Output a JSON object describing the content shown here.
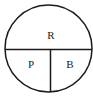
{
  "diagram": {
    "type": "divided-circle",
    "regions": [
      {
        "id": "top",
        "label": "R",
        "position": "top-half"
      },
      {
        "id": "bottom-left",
        "label": "P",
        "position": "bottom-left-quarter"
      },
      {
        "id": "bottom-right",
        "label": "B",
        "position": "bottom-right-quarter"
      }
    ],
    "stroke_color": "#1a1a1a",
    "background": "#ffffff"
  }
}
